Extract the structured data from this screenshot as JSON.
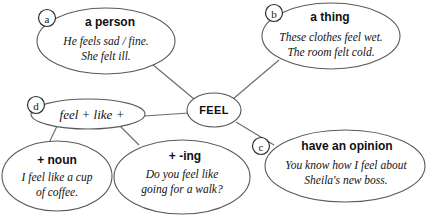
{
  "diagram": {
    "title": "FEEL",
    "type": "word-map",
    "center": {
      "label": "FEEL",
      "marker": ""
    },
    "nodes": [
      {
        "id": "a",
        "marker": "a",
        "heading": "a person",
        "examples": [
          "He feels sad / fine.",
          "She felt ill."
        ]
      },
      {
        "id": "b",
        "marker": "b",
        "heading": "a thing",
        "examples": [
          "These clothes feel wet.",
          "The room felt cold."
        ]
      },
      {
        "id": "c",
        "marker": "c",
        "heading": "have an opinion",
        "examples": [
          "You know how I feel about",
          "Sheila's new boss."
        ]
      },
      {
        "id": "d",
        "marker": "d",
        "heading": "feel + like +",
        "examples": []
      },
      {
        "id": "noun",
        "marker": "",
        "heading": "+ noun",
        "examples": [
          "I feel like a cup",
          "of coffee."
        ]
      },
      {
        "id": "ing",
        "marker": "",
        "heading": "+ -ing",
        "examples": [
          "Do you feel like",
          "going for a walk?"
        ]
      }
    ],
    "colors": {
      "stroke": "#5a5a58",
      "text": "#101010",
      "background": "#ffffff"
    }
  }
}
